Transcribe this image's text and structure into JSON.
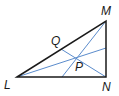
{
  "diagram": {
    "type": "triangle-geometry",
    "colors": {
      "triangle_stroke": "#1a1a1a",
      "segment_stroke": "#5b8ccc",
      "label": "#1a1a1a"
    },
    "vertices": {
      "L": {
        "label": "L",
        "x": 17,
        "y": 77
      },
      "M": {
        "label": "M",
        "x": 106,
        "y": 21
      },
      "N": {
        "label": "N",
        "x": 106,
        "y": 77
      }
    },
    "points": {
      "Q": {
        "label": "Q",
        "x": 61,
        "y": 49
      },
      "P": {
        "label": "P",
        "x": 78,
        "y": 58
      }
    },
    "segments": [
      {
        "name": "segment-QN",
        "from": "Q",
        "to": "N"
      },
      {
        "name": "segment-M-to-LN",
        "from": "M",
        "to_point": {
          "x": 62,
          "y": 77
        }
      },
      {
        "name": "segment-L-to-MN",
        "from": "L",
        "to_point": {
          "x": 106,
          "y": 48
        }
      }
    ],
    "labels": {
      "L": "L",
      "M": "M",
      "N": "N",
      "Q": "Q",
      "P": "P"
    }
  }
}
